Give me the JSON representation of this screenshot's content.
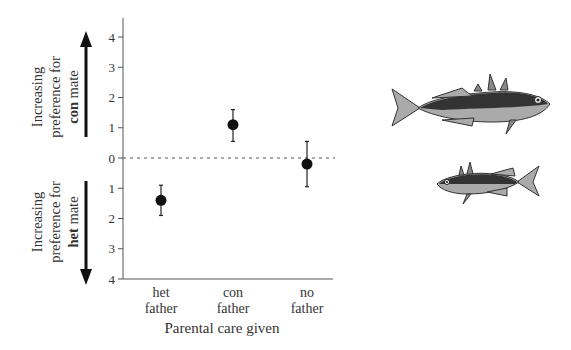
{
  "chart_data": {
    "type": "scatter",
    "subtype": "point-with-error-bars",
    "title": "",
    "xlabel": "Parental care given",
    "ylabel_upper": {
      "lines": [
        "Increasing",
        "preference for"
      ],
      "bold": "con",
      "rest": " mate"
    },
    "ylabel_lower": {
      "lines": [
        "Increasing",
        "preference for"
      ],
      "bold": "het",
      "rest": " mate"
    },
    "categories": [
      {
        "line1": "het",
        "line2": "father"
      },
      {
        "line1": "con",
        "line2": "father"
      },
      {
        "line1": "no",
        "line2": "father"
      }
    ],
    "series": [
      {
        "name": "Mate preference",
        "values": [
          -1.4,
          1.1,
          -0.2
        ],
        "error_low": [
          -1.9,
          0.55,
          -0.95
        ],
        "error_high": [
          -0.9,
          1.6,
          0.55
        ]
      }
    ],
    "ylim": [
      -4,
      4
    ],
    "yticks": [
      4,
      3,
      2,
      1,
      0,
      -1,
      -2,
      -3,
      -4
    ],
    "ytick_labels": [
      "4",
      "3",
      "2",
      "1",
      "0",
      "1",
      "2",
      "3",
      "4"
    ],
    "reference_line": {
      "y": 0,
      "style": "dotted"
    },
    "grid": false,
    "legend": "none",
    "illustrations": [
      "stickleback-fish-large",
      "stickleback-fish-small"
    ]
  }
}
